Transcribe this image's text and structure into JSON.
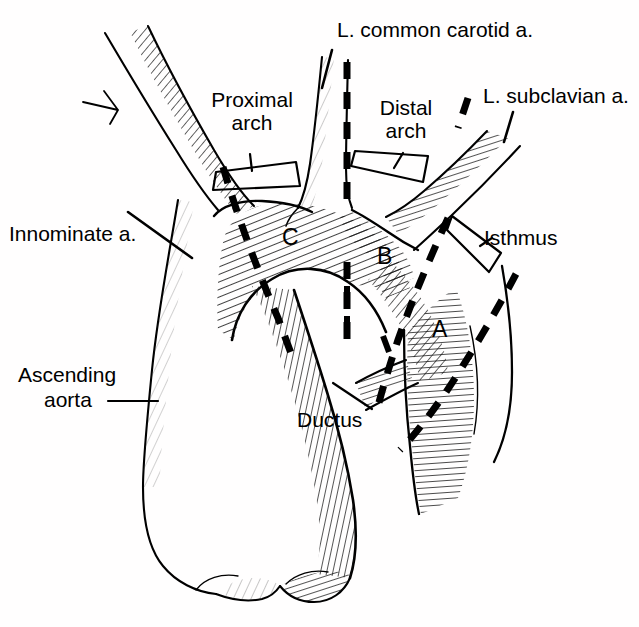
{
  "figure": {
    "background_color": "#ffffff",
    "ink_color": "#000000",
    "width": 639,
    "height": 627
  },
  "labels": {
    "common_carotid": "L. common carotid a.",
    "subclavian": "L. subclavian a.",
    "innominate": "Innominate a.",
    "proximal_arch_line1": "Proximal",
    "proximal_arch_line2": "arch",
    "distal_arch_line1": "Distal",
    "distal_arch_line2": "arch",
    "isthmus": "Isthmus",
    "ductus": "Ductus",
    "ascending_line1": "Ascending",
    "ascending_line2": "aorta"
  },
  "segment_markers": [
    {
      "id": "A",
      "label": "A",
      "x": 432,
      "y": 316
    },
    {
      "id": "B",
      "label": "B",
      "x": 377,
      "y": 243
    },
    {
      "id": "C",
      "label": "C",
      "x": 282,
      "y": 224
    }
  ],
  "brackets": [
    {
      "name": "proximal-arch-bracket",
      "for": "Proximal arch"
    },
    {
      "name": "distal-arch-bracket",
      "for": "Distal arch"
    },
    {
      "name": "isthmus-bracket",
      "for": "Isthmus"
    }
  ],
  "dashed_transection_lines": [
    {
      "name": "proximal-arch-transection",
      "segment_boundary": "C"
    },
    {
      "name": "mid-arch-transection",
      "segment_boundary": "B/C"
    },
    {
      "name": "distal-arch-transection",
      "segment_boundary": "A/B"
    },
    {
      "name": "isthmus-transection",
      "segment_boundary": "A"
    }
  ],
  "leader_lines": [
    {
      "name": "carotid-leader"
    },
    {
      "name": "subclavian-leader"
    },
    {
      "name": "innominate-leader"
    },
    {
      "name": "ascending-aorta-leader"
    },
    {
      "name": "ductus-leader"
    }
  ]
}
